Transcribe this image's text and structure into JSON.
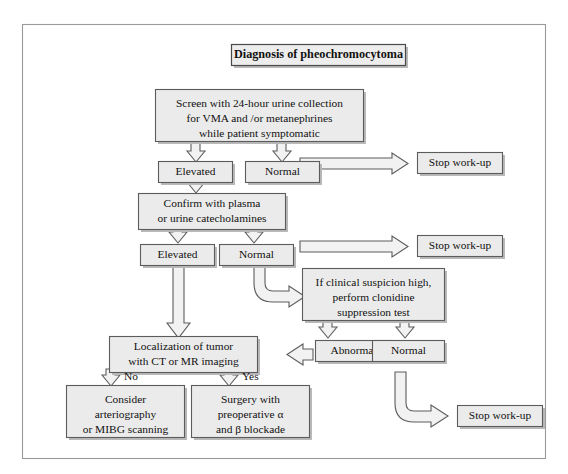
{
  "figure": {
    "kind": "clinical-decision-flowchart",
    "title": "Diagnosis of pheochromocytoma",
    "colors": {
      "page_background": "#ffffff",
      "frame_border": "#9a9a9a",
      "node_fill": "#ebebeb",
      "node_border": "#5c5c5c",
      "arrow_fill": "#f2f2f2",
      "arrow_border": "#5c5c5c",
      "text": "#111111",
      "shadow": "#b9b9b9"
    }
  },
  "nodes": {
    "title": {
      "text": "Diagnosis of pheochromocytoma"
    },
    "screen": {
      "lines": [
        "Screen with 24-hour urine collection",
        "for VMA and /or metanephrines",
        "while patient symptomatic"
      ]
    },
    "elevated_1": {
      "text": "Elevated"
    },
    "normal_1": {
      "text": "Normal"
    },
    "stop_1": {
      "text": "Stop work-up"
    },
    "confirm": {
      "lines": [
        "Confirm with plasma",
        "or urine catecholamines"
      ]
    },
    "elevated_2": {
      "text": "Elevated"
    },
    "normal_2": {
      "text": "Normal"
    },
    "stop_2": {
      "text": "Stop work-up"
    },
    "clonidine": {
      "lines": [
        "If clinical suspicion high,",
        "perform clonidine",
        "suppression test"
      ]
    },
    "localization": {
      "lines": [
        "Localization of tumor",
        "with CT or MR imaging"
      ]
    },
    "abnormal": {
      "text": "Abnormal"
    },
    "normal_3": {
      "text": "Normal"
    },
    "stop_3": {
      "text": "Stop work-up"
    },
    "consider": {
      "lines": [
        "Consider",
        "arteriography",
        "or MIBG scanning"
      ]
    },
    "surgery": {
      "lines": [
        "Surgery with",
        "preoperative α",
        "and β blockade"
      ]
    }
  },
  "edge_labels": {
    "no": "No",
    "yes": "Yes"
  }
}
